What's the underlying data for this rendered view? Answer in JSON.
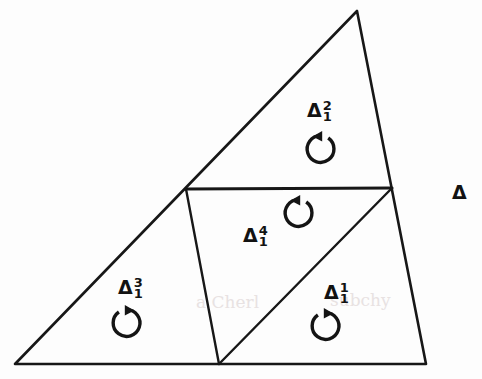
{
  "figure": {
    "type": "geometric-diagram",
    "background_color": "#fdfdfd",
    "line_color": "#171717",
    "text_color": "#121212",
    "canvas": {
      "width": 482,
      "height": 379
    }
  },
  "outer_triangle": {
    "name": "outer-triangle",
    "vertices": {
      "bottom_left": {
        "x": 15,
        "y": 364
      },
      "apex": {
        "x": 357,
        "y": 11
      },
      "bottom_right": {
        "x": 426,
        "y": 364
      }
    },
    "points_attr": "15,364 357,11 426,364"
  },
  "midpoints": {
    "left_edge_mid": {
      "x": 186,
      "y": 189
    },
    "right_edge_mid": {
      "x": 392,
      "y": 188
    },
    "bottom_edge_mid": {
      "x": 219,
      "y": 364
    }
  },
  "internal_edges": [
    {
      "name": "midline-horizontal",
      "d": "M 186 189 L 392 188"
    },
    {
      "name": "midline-left-vertical",
      "d": "M 186 189 L 219 364"
    },
    {
      "name": "midline-diagonal",
      "d": "M 219 364 L 392 188"
    }
  ],
  "sub_triangles": [
    {
      "id": "delta-1-1",
      "name": "sub-triangle-delta-1-1",
      "delta": "Δ",
      "superscript": "1",
      "subscript": "1",
      "position": "bottom-right",
      "label_left": 324,
      "label_top": 283,
      "arrow_left": 303,
      "arrow_top": 306,
      "arrow_variant": "head-top-right",
      "orientation": "counterclockwise"
    },
    {
      "id": "delta-1-2",
      "name": "sub-triangle-delta-1-2",
      "delta": "Δ",
      "superscript": "2",
      "subscript": "1",
      "position": "top",
      "label_left": 307,
      "label_top": 101,
      "arrow_left": 303,
      "arrow_top": 129,
      "arrow_variant": "head-top-left",
      "orientation": "counterclockwise"
    },
    {
      "id": "delta-1-3",
      "name": "sub-triangle-delta-1-3",
      "delta": "Δ",
      "superscript": "3",
      "subscript": "1",
      "position": "bottom-left",
      "label_left": 118,
      "label_top": 278,
      "arrow_left": 104,
      "arrow_top": 303,
      "arrow_variant": "head-top-right",
      "orientation": "counterclockwise"
    },
    {
      "id": "delta-1-4",
      "name": "sub-triangle-delta-1-4",
      "delta": "Δ",
      "superscript": "4",
      "subscript": "1",
      "position": "center-inverted",
      "label_left": 243,
      "label_top": 226,
      "arrow_left": 281,
      "arrow_top": 193,
      "arrow_variant": "head-top-left",
      "orientation": "counterclockwise"
    }
  ],
  "standalone_symbol": {
    "name": "standalone-delta-symbol",
    "glyph": "Δ",
    "left": 452,
    "top": 183
  },
  "scan_artifacts": [
    {
      "text": "a Cherl",
      "left": 196,
      "top": 292
    },
    {
      "text": "subchy",
      "left": 330,
      "top": 290
    }
  ]
}
